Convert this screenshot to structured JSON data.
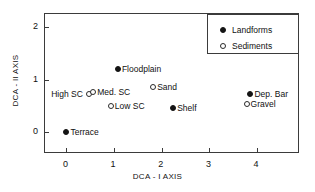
{
  "chart_data": {
    "type": "scatter",
    "title": "",
    "xlabel": "DCA - I AXIS",
    "ylabel": "DCA - II AXIS",
    "xlim": [
      -0.45,
      4.9
    ],
    "ylim": [
      -0.42,
      2.25
    ],
    "xticks": [
      "0",
      "1",
      "2",
      "3",
      "4"
    ],
    "yticks": [
      "0",
      "1",
      "2"
    ],
    "grid": false,
    "legend_position": "top-right",
    "legend": [
      {
        "name": "Landforms",
        "marker": "filled-circle"
      },
      {
        "name": "Sediments",
        "marker": "open-circle"
      }
    ],
    "series": [
      {
        "name": "Landforms",
        "marker": "filled-circle",
        "points": [
          {
            "label": "Terrace",
            "x": 0.0,
            "y": 0.0,
            "label_side": "right"
          },
          {
            "label": "Floodplain",
            "x": 1.08,
            "y": 1.21,
            "label_side": "right"
          },
          {
            "label": "Shelf",
            "x": 2.24,
            "y": 0.46,
            "label_side": "right"
          },
          {
            "label": "Dep. Bar",
            "x": 3.86,
            "y": 0.73,
            "label_side": "right"
          }
        ]
      },
      {
        "name": "Sediments",
        "marker": "open-circle",
        "points": [
          {
            "label": "High SC",
            "x": 0.47,
            "y": 0.73,
            "label_side": "left"
          },
          {
            "label": "Med. SC",
            "x": 0.56,
            "y": 0.76,
            "label_side": "right"
          },
          {
            "label": "Low SC",
            "x": 0.93,
            "y": 0.5,
            "label_side": "right"
          },
          {
            "label": "Sand",
            "x": 1.82,
            "y": 0.86,
            "label_side": "right"
          },
          {
            "label": "Gravel",
            "x": 3.78,
            "y": 0.54,
            "label_side": "right"
          }
        ]
      }
    ]
  }
}
